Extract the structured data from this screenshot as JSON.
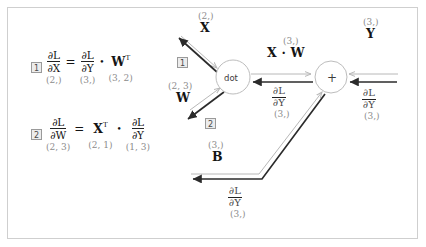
{
  "figure": {
    "title_hidden": "",
    "colors": {
      "forward_arrow": "#b8b8b8",
      "backward_arrow": "#2b2b2b",
      "node_stroke": "#bdbdbd",
      "frame_border": "#cfcfcf",
      "dim_text": "#8c8c8c",
      "main_text": "#141414",
      "step_box_fill": "#ececec"
    }
  },
  "formulas": [
    {
      "step": "1",
      "lhs": {
        "num": "∂L",
        "den": "∂X",
        "dim": "(2,)"
      },
      "equals": "=",
      "rhs_frac": {
        "num": "∂L",
        "den": "∂Y",
        "dim": "(3,)"
      },
      "operator": "•",
      "rhs_term": {
        "symbol": "W",
        "transpose": "T",
        "dim": "(3, 2)"
      }
    },
    {
      "step": "2",
      "lhs": {
        "num": "∂L",
        "den": "∂W",
        "dim": "(2, 3)"
      },
      "equals": "=",
      "rhs_term": {
        "symbol": "X",
        "transpose": "T",
        "dim": "(2, 1)"
      },
      "operator": "•",
      "rhs_frac": {
        "num": "∂L",
        "den": "∂Y",
        "dim": "(1, 3)"
      }
    }
  ],
  "nodes": [
    {
      "id": "dot",
      "label": "dot",
      "cx": 233,
      "cy": 77,
      "r": 17
    },
    {
      "id": "plus",
      "label": "+",
      "cx": 331,
      "cy": 77,
      "r": 16
    }
  ],
  "graph_labels": {
    "input_x": {
      "name": "X",
      "dim": "(2,)"
    },
    "input_w": {
      "name": "W",
      "dim": "(2, 3)"
    },
    "input_b": {
      "name": "B",
      "dim": "(3,)"
    },
    "input_y": {
      "name": "Y",
      "dim": "(3,)"
    },
    "intermediate_xw": {
      "name": "X · W",
      "dim": "(3,)"
    },
    "grad_xw": {
      "num": "∂L",
      "den": "∂Y",
      "dim": "(3,)"
    },
    "grad_y_right": {
      "num": "∂L",
      "den": "∂Y",
      "dim": "(3,)"
    },
    "grad_b": {
      "num": "∂L",
      "den": "∂Y",
      "dim": "(3,)"
    }
  },
  "step_markers": [
    {
      "label": "1",
      "x": 177,
      "y": 57
    },
    {
      "label": "2",
      "x": 205,
      "y": 118
    }
  ]
}
